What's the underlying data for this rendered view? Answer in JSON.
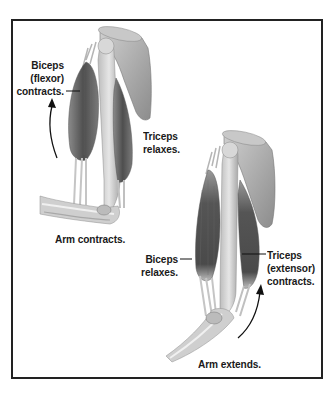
{
  "diagram": {
    "title": "",
    "panels": [
      {
        "name": "flexion",
        "labels": {
          "biceps": [
            "Biceps",
            "(flexor)",
            "contracts."
          ],
          "triceps": [
            "Triceps",
            "relaxes."
          ],
          "caption": "Arm contracts."
        }
      },
      {
        "name": "extension",
        "labels": {
          "biceps": [
            "Biceps",
            "relaxes."
          ],
          "triceps": [
            "Triceps",
            "(extensor)",
            "contracts."
          ],
          "caption": "Arm extends."
        }
      }
    ],
    "colors": {
      "border": "#222222",
      "muscle_dark": "#5a5a5a",
      "bone_light": "#d4d4d4",
      "text": "#1a1a1a"
    }
  }
}
